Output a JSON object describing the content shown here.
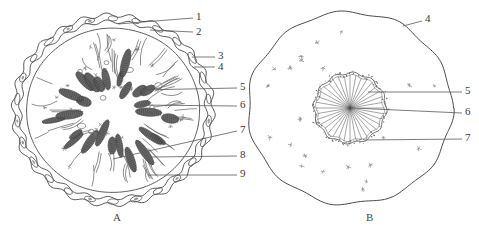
{
  "figure": {
    "background_color": "#ffffff",
    "ink_color": "#4a4a4a",
    "label_color": "#3a3a3a"
  },
  "panels": [
    {
      "id": "A",
      "caption": "A",
      "caption_x": 113,
      "caption_y": 218
    },
    {
      "id": "B",
      "caption": "B",
      "caption_x": 366,
      "caption_y": 218
    }
  ],
  "labels": [
    {
      "id": "label-1",
      "text": "1",
      "x": 196,
      "y": 16,
      "panel": "A"
    },
    {
      "id": "label-2",
      "text": "2",
      "x": 196,
      "y": 31,
      "panel": "A"
    },
    {
      "id": "label-3",
      "text": "3",
      "x": 218,
      "y": 54,
      "panel": "A"
    },
    {
      "id": "label-4",
      "text": "4",
      "x": 218,
      "y": 65,
      "panel": "A"
    },
    {
      "id": "label-5",
      "text": "5",
      "x": 240,
      "y": 85,
      "panel": "A"
    },
    {
      "id": "label-6",
      "text": "6",
      "x": 240,
      "y": 103,
      "panel": "A"
    },
    {
      "id": "label-7",
      "text": "7",
      "x": 240,
      "y": 128,
      "panel": "A"
    },
    {
      "id": "label-8",
      "text": "8",
      "x": 240,
      "y": 153,
      "panel": "A"
    },
    {
      "id": "label-9",
      "text": "9",
      "x": 240,
      "y": 172,
      "panel": "A"
    },
    {
      "id": "label-b-4",
      "text": "4",
      "x": 425,
      "y": 18,
      "panel": "B"
    },
    {
      "id": "label-b-5",
      "text": "5",
      "x": 465,
      "y": 89,
      "panel": "B"
    },
    {
      "id": "label-b-6",
      "text": "6",
      "x": 465,
      "y": 110,
      "panel": "B"
    },
    {
      "id": "label-b-7",
      "text": "7",
      "x": 465,
      "y": 136,
      "panel": "B"
    }
  ],
  "leader_lines": [
    {
      "id": "leader-1",
      "x1": 118,
      "y1": 24,
      "x2": 193,
      "y2": 18
    },
    {
      "id": "leader-2",
      "x1": 150,
      "y1": 30,
      "x2": 193,
      "y2": 32
    },
    {
      "id": "leader-3",
      "x1": 192,
      "y1": 57,
      "x2": 215,
      "y2": 57
    },
    {
      "id": "leader-4",
      "x1": 194,
      "y1": 67,
      "x2": 215,
      "y2": 67
    },
    {
      "id": "leader-5",
      "x1": 137,
      "y1": 90,
      "x2": 237,
      "y2": 88
    },
    {
      "id": "leader-6",
      "x1": 141,
      "y1": 105,
      "x2": 237,
      "y2": 106
    },
    {
      "id": "leader-7",
      "x1": 113,
      "y1": 159,
      "x2": 237,
      "y2": 131
    },
    {
      "id": "leader-8",
      "x1": 150,
      "y1": 157,
      "x2": 237,
      "y2": 156
    },
    {
      "id": "leader-9",
      "x1": 148,
      "y1": 175,
      "x2": 237,
      "y2": 175
    },
    {
      "id": "leader-b-4",
      "x1": 403,
      "y1": 26,
      "x2": 422,
      "y2": 21
    },
    {
      "id": "leader-b-5",
      "x1": 368,
      "y1": 92,
      "x2": 462,
      "y2": 92
    },
    {
      "id": "leader-b-6",
      "x1": 352,
      "y1": 108,
      "x2": 462,
      "y2": 113
    },
    {
      "id": "leader-b-7",
      "x1": 364,
      "y1": 140,
      "x2": 462,
      "y2": 139
    }
  ],
  "structures": {
    "panel_a": {
      "name": "transverse-section-with-epithelium",
      "outer_boundary": "scalloped-double-wall",
      "outer_cells_count": 26,
      "inner_dark_bodies_count": 26,
      "inner_wisps_count": 46,
      "small_specks_count": 30,
      "center_x": 113,
      "center_y": 110,
      "outer_radius_x": 100,
      "outer_radius_y": 95
    },
    "panel_b": {
      "name": "transverse-section-with-central-rosette",
      "outer_boundary": "wavy-single-wall",
      "center_x": 350,
      "center_y": 108,
      "outer_radius_x": 102,
      "outer_radius_y": 96,
      "rosette_radius": 36,
      "rosette_spokes": 36,
      "scattered_specks_count": 22
    }
  }
}
